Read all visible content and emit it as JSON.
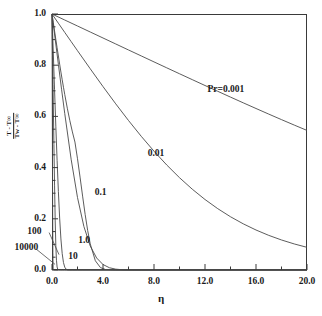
{
  "chart_data": {
    "type": "line",
    "title": "",
    "subtitle": "",
    "xlabel": "η",
    "ylabel_numerator": "T - T∞",
    "ylabel_denominator": "Tw - T∞",
    "xlim": [
      0.0,
      20.0
    ],
    "ylim": [
      0.0,
      1.0
    ],
    "xticks": [
      "0.0",
      "4.0",
      "8.0",
      "12.0",
      "16.0",
      "20.0"
    ],
    "xtick_values": [
      0.0,
      4.0,
      8.0,
      12.0,
      16.0,
      20.0
    ],
    "yticks": [
      "0.0",
      "0.2",
      "0.4",
      "0.6",
      "0.8",
      "1.0"
    ],
    "ytick_values": [
      0.0,
      0.2,
      0.4,
      0.6,
      0.8,
      1.0
    ],
    "x_minor_tick_step": 2.0,
    "y_minor_tick_step": 0.05,
    "grid": false,
    "legend": "inline-curve-labels",
    "legend_position": "none",
    "line_color": "#4a4a4a",
    "axis_color": "#3a3a3a",
    "background": "#ffffff",
    "series": [
      {
        "name": "Pr=0.001",
        "label": "Pr=0.001",
        "label_x": 12.2,
        "label_y": 0.705,
        "leader": false,
        "x": [
          0.0,
          1.0,
          2.0,
          3.0,
          4.0,
          5.0,
          6.0,
          7.0,
          8.0,
          9.0,
          10.0,
          11.0,
          12.0,
          13.0,
          14.0,
          15.0,
          16.0,
          17.0,
          18.0,
          19.0,
          20.0
        ],
        "values": [
          1.0,
          0.9765,
          0.9531,
          0.9297,
          0.9063,
          0.8829,
          0.8595,
          0.8362,
          0.8129,
          0.7897,
          0.7666,
          0.7436,
          0.7207,
          0.698,
          0.6754,
          0.653,
          0.6309,
          0.609,
          0.5874,
          0.5661,
          0.5452
        ]
      },
      {
        "name": "Pr=0.01",
        "label": "0.01",
        "label_x": 7.5,
        "label_y": 0.455,
        "leader": false,
        "x": [
          0.0,
          0.5,
          1.0,
          1.5,
          2.0,
          3.0,
          4.0,
          5.0,
          6.0,
          7.0,
          8.0,
          9.0,
          10.0,
          11.0,
          12.0,
          13.0,
          14.0,
          15.0,
          16.0,
          17.0,
          18.0,
          19.0,
          20.0
        ],
        "values": [
          1.0,
          0.964,
          0.9281,
          0.8923,
          0.8566,
          0.7859,
          0.7165,
          0.649,
          0.584,
          0.5222,
          0.4641,
          0.4101,
          0.3606,
          0.3157,
          0.2754,
          0.2396,
          0.208,
          0.1803,
          0.1562,
          0.1353,
          0.1173,
          0.1018,
          0.0885
        ]
      },
      {
        "name": "Pr=0.1",
        "label": "0.1",
        "label_x": 3.35,
        "label_y": 0.3,
        "leader": false,
        "x": [
          0.0,
          0.25,
          0.5,
          0.75,
          1.0,
          1.5,
          2.0,
          2.5,
          3.0,
          3.5,
          4.0,
          4.5,
          5.0,
          5.5,
          6.0,
          6.5,
          7.0,
          7.5,
          8.0,
          8.5,
          9.0,
          9.5,
          10.0,
          11.0,
          12.0,
          14.0,
          16.0,
          18.0,
          20.0
        ],
        "values": [
          1.0,
          0.9014,
          0.8033,
          0.7062,
          0.611,
          0.4327,
          0.283,
          0.17,
          0.0935,
          0.0469,
          0.0214,
          0.0089,
          0.0033,
          0.0011,
          0.00035,
          0.0001,
          3e-05,
          1e-05,
          0.0,
          0.0,
          0.0,
          0.0,
          0.0,
          0.0,
          0.0,
          0.0,
          0.0,
          0.0,
          0.0
        ]
      },
      {
        "name": "Pr=1.0",
        "label": "1.0",
        "label_x": 2.05,
        "label_y": 0.115,
        "leader": false,
        "x": [
          0.0,
          0.1,
          0.2,
          0.3,
          0.4,
          0.5,
          0.6,
          0.7,
          0.8,
          0.9,
          1.0,
          1.2,
          1.4,
          1.6,
          1.8,
          2.0,
          2.2,
          2.4,
          2.6,
          2.8,
          3.0,
          3.4,
          3.8,
          4.2,
          5.0,
          6.0,
          8.0,
          12.0,
          20.0
        ],
        "values": [
          1.0,
          0.9668,
          0.9337,
          0.9007,
          0.8681,
          0.8359,
          0.8042,
          0.7732,
          0.743,
          0.7137,
          0.6854,
          0.632,
          0.5833,
          0.5393,
          0.4998,
          0.4346,
          0.3628,
          0.2886,
          0.2172,
          0.1538,
          0.1018,
          0.036,
          0.0094,
          0.0018,
          0.0,
          0.0,
          0.0,
          0.0,
          0.0
        ]
      },
      {
        "name": "Pr=10",
        "label": "10",
        "label_x": 1.28,
        "label_y": 0.052,
        "leader": false,
        "x": [
          0.0,
          0.05,
          0.1,
          0.15,
          0.2,
          0.3,
          0.4,
          0.5,
          0.6,
          0.7,
          0.8,
          0.9,
          1.0,
          1.1,
          1.2,
          1.3,
          1.4,
          1.5,
          1.6,
          1.8,
          2.0,
          2.4,
          3.0,
          4.0,
          6.0,
          10.0,
          20.0
        ],
        "values": [
          1.0,
          0.9254,
          0.851,
          0.7772,
          0.7041,
          0.5619,
          0.428,
          0.3066,
          0.2028,
          0.1213,
          0.064,
          0.029,
          0.011,
          0.0034,
          0.0008,
          0.00015,
          2e-05,
          0.0,
          0.0,
          0.0,
          0.0,
          0.0,
          0.0,
          0.0,
          0.0,
          0.0,
          0.0
        ]
      },
      {
        "name": "Pr=100",
        "label": "100",
        "label_x": -1.95,
        "label_y": 0.15,
        "leader": true,
        "leader_to_x": 0.55,
        "leader_to_y": 0.06,
        "x": [
          0.0,
          0.02,
          0.05,
          0.08,
          0.1,
          0.15,
          0.2,
          0.25,
          0.3,
          0.35,
          0.4,
          0.45,
          0.5,
          0.55,
          0.6,
          0.65,
          0.7,
          0.8,
          1.0,
          1.4,
          2.0,
          4.0,
          10.0,
          20.0
        ],
        "values": [
          1.0,
          0.9306,
          0.8271,
          0.7243,
          0.6562,
          0.4896,
          0.3316,
          0.195,
          0.0955,
          0.0381,
          0.0119,
          0.0028,
          0.0005,
          6e-05,
          0.0,
          0.0,
          0.0,
          0.0,
          0.0,
          0.0,
          0.0,
          0.0,
          0.0,
          0.0
        ]
      },
      {
        "name": "Pr=10000",
        "label": "10000",
        "label_x": -2.95,
        "label_y": 0.085,
        "leader": true,
        "leader_to_x": 0.24,
        "leader_to_y": 0.022,
        "x": [
          0.0,
          0.005,
          0.01,
          0.02,
          0.03,
          0.04,
          0.05,
          0.06,
          0.07,
          0.08,
          0.09,
          0.1,
          0.12,
          0.14,
          0.16,
          0.2,
          0.3,
          0.5,
          1.0,
          2.0,
          5.0,
          10.0,
          20.0
        ],
        "values": [
          1.0,
          0.9196,
          0.8393,
          0.68,
          0.5243,
          0.3773,
          0.2465,
          0.1412,
          0.0676,
          0.0256,
          0.0072,
          0.0014,
          2e-05,
          0.0,
          0.0,
          0.0,
          0.0,
          0.0,
          0.0,
          0.0,
          0.0,
          0.0,
          0.0
        ]
      }
    ]
  }
}
